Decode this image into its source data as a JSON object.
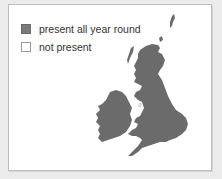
{
  "legend": {
    "items": [
      {
        "label": "present all year round",
        "status": "present",
        "color": "#7a7a7a"
      },
      {
        "label": "not present",
        "status": "absent",
        "color": "#ffffff"
      }
    ]
  },
  "map": {
    "region": "British Isles",
    "fill_color": "#6b6b6b",
    "areas": [
      "Great Britain",
      "Ireland",
      "Shetland",
      "Orkney",
      "Hebrides"
    ]
  }
}
